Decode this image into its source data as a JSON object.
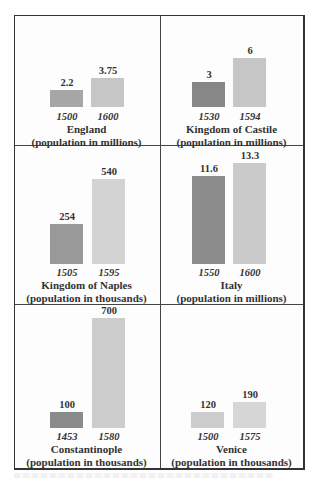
{
  "chart_data": [
    {
      "type": "bar",
      "title": "England",
      "subtitle": "(population in millions)",
      "categories": [
        "1500",
        "1600"
      ],
      "values": [
        2.2,
        3.75
      ],
      "value_labels": [
        "2.2",
        "3.75"
      ],
      "xlabel": "",
      "ylabel": "population in millions",
      "colors": [
        "#a6a6a6",
        "#c6c6c6"
      ]
    },
    {
      "type": "bar",
      "title": "Kingdom of Castile",
      "subtitle": "(population in millions)",
      "categories": [
        "1530",
        "1594"
      ],
      "values": [
        3,
        6
      ],
      "value_labels": [
        "3",
        "6"
      ],
      "xlabel": "",
      "ylabel": "population in millions",
      "colors": [
        "#878787",
        "#c6c6c6"
      ]
    },
    {
      "type": "bar",
      "title": "Kingdom of Naples",
      "subtitle": "(population in thousands)",
      "categories": [
        "1505",
        "1595"
      ],
      "values": [
        254,
        540
      ],
      "value_labels": [
        "254",
        "540"
      ],
      "xlabel": "",
      "ylabel": "population in thousands",
      "colors": [
        "#999999",
        "#d3d3d3"
      ]
    },
    {
      "type": "bar",
      "title": "Italy",
      "subtitle": "(population in millions)",
      "categories": [
        "1550",
        "1600"
      ],
      "values": [
        11.6,
        13.3
      ],
      "value_labels": [
        "11.6",
        "13.3"
      ],
      "xlabel": "",
      "ylabel": "population in millions",
      "colors": [
        "#8c8c8c",
        "#cacaca"
      ]
    },
    {
      "type": "bar",
      "title": "Constantinople",
      "subtitle": "(population in thousands)",
      "categories": [
        "1453",
        "1580"
      ],
      "values": [
        100,
        700
      ],
      "value_labels": [
        "100",
        "700"
      ],
      "xlabel": "",
      "ylabel": "population in thousands",
      "colors": [
        "#8a8a8a",
        "#cdcdcd"
      ]
    },
    {
      "type": "bar",
      "title": "Venice",
      "subtitle": "(population in thousands)",
      "categories": [
        "1500",
        "1575"
      ],
      "values": [
        120,
        190
      ],
      "value_labels": [
        "120",
        "190"
      ],
      "xlabel": "",
      "ylabel": "population in thousands",
      "colors": [
        "#cccccc",
        "#d6d6d6"
      ]
    }
  ],
  "layout": {
    "grid": "3 rows x 2 columns",
    "legend": "none"
  }
}
